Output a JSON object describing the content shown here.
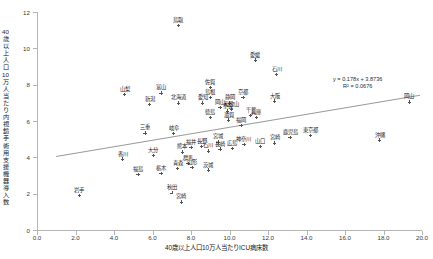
{
  "chart_data": {
    "type": "scatter",
    "title": "",
    "xlabel": "40歳以上人口10万人当たりICU病床数",
    "ylabel": "40歳以上人口10万人当たり内視鏡手術用支援機器導入数",
    "xlim": [
      0.0,
      20.0
    ],
    "ylim": [
      0,
      12
    ],
    "xticks": [
      "0.0",
      "2.0",
      "4.0",
      "6.0",
      "8.0",
      "10.0",
      "12.0",
      "14.0",
      "16.0",
      "18.0",
      "20.0"
    ],
    "yticks": [
      "0",
      "2",
      "4",
      "6",
      "8",
      "10",
      "12"
    ],
    "grid": false,
    "legend": null,
    "trendline": {
      "equation": "y = 0.178x + 3.8736",
      "r2": "R² = 0.0676",
      "slope": 0.178,
      "intercept": 3.8736
    },
    "point_style": "plus-marker",
    "points": [
      {
        "label": "鳥取",
        "x": 7.35,
        "y": 11.25
      },
      {
        "label": "愛媛",
        "x": 11.35,
        "y": 9.35
      },
      {
        "label": "石川",
        "x": 12.45,
        "y": 8.55
      },
      {
        "label": "佐賀",
        "x": 9.0,
        "y": 7.85
      },
      {
        "label": "山梨",
        "x": 4.55,
        "y": 7.45
      },
      {
        "label": "富山",
        "x": 6.45,
        "y": 7.55
      },
      {
        "label": "島根",
        "x": 9.0,
        "y": 7.3
      },
      {
        "label": "京都",
        "x": 10.7,
        "y": 7.3
      },
      {
        "label": "大阪",
        "x": 12.35,
        "y": 7.1
      },
      {
        "label": "北海道",
        "x": 7.35,
        "y": 7.0
      },
      {
        "label": "愛知",
        "x": 8.6,
        "y": 7.0
      },
      {
        "label": "静岡",
        "x": 10.0,
        "y": 7.0
      },
      {
        "label": "新潟",
        "x": 5.85,
        "y": 6.9
      },
      {
        "label": "岡山",
        "x": 9.5,
        "y": 6.75
      },
      {
        "label": "和歌山",
        "x": 10.1,
        "y": 6.65
      },
      {
        "label": "奈良",
        "x": 9.9,
        "y": 6.55
      },
      {
        "label": "徳島",
        "x": 9.0,
        "y": 6.2
      },
      {
        "label": "滋賀",
        "x": 9.95,
        "y": 6.05
      },
      {
        "label": "千葉",
        "x": 11.1,
        "y": 6.3
      },
      {
        "label": "兵庫",
        "x": 11.4,
        "y": 6.2
      },
      {
        "label": "福岡",
        "x": 10.6,
        "y": 5.75
      },
      {
        "label": "三重",
        "x": 5.6,
        "y": 5.35
      },
      {
        "label": "岐阜",
        "x": 7.1,
        "y": 5.3
      },
      {
        "label": "沖縄",
        "x": 17.8,
        "y": 4.95
      },
      {
        "label": "東京都",
        "x": 14.2,
        "y": 5.2
      },
      {
        "label": "岡山",
        "x": 19.35,
        "y": 7.05
      },
      {
        "label": "鹿児島",
        "x": 13.15,
        "y": 5.1
      },
      {
        "label": "宮城",
        "x": 9.4,
        "y": 4.85
      },
      {
        "label": "神奈川",
        "x": 10.75,
        "y": 4.7
      },
      {
        "label": "広島",
        "x": 10.15,
        "y": 4.5
      },
      {
        "label": "長崎",
        "x": 9.5,
        "y": 4.45
      },
      {
        "label": "山口",
        "x": 11.6,
        "y": 4.6
      },
      {
        "label": "宮崎",
        "x": 12.35,
        "y": 4.8
      },
      {
        "label": "長野",
        "x": 8.55,
        "y": 4.6
      },
      {
        "label": "福井",
        "x": 8.0,
        "y": 4.55
      },
      {
        "label": "石川",
        "x": 8.9,
        "y": 4.35
      },
      {
        "label": "熊本",
        "x": 7.55,
        "y": 4.3
      },
      {
        "label": "大分",
        "x": 6.05,
        "y": 4.1
      },
      {
        "label": "香川",
        "x": 4.45,
        "y": 3.9
      },
      {
        "label": "群馬",
        "x": 7.85,
        "y": 3.65
      },
      {
        "label": "山形",
        "x": 8.05,
        "y": 3.45
      },
      {
        "label": "青森",
        "x": 7.3,
        "y": 3.4
      },
      {
        "label": "茨城",
        "x": 8.9,
        "y": 3.3
      },
      {
        "label": "栃木",
        "x": 6.45,
        "y": 3.1
      },
      {
        "label": "福島",
        "x": 5.25,
        "y": 3.05
      },
      {
        "label": "秋田",
        "x": 7.0,
        "y": 2.05
      },
      {
        "label": "岩手",
        "x": 2.2,
        "y": 1.9
      },
      {
        "label": "宮崎",
        "x": 7.5,
        "y": 1.55
      }
    ]
  }
}
